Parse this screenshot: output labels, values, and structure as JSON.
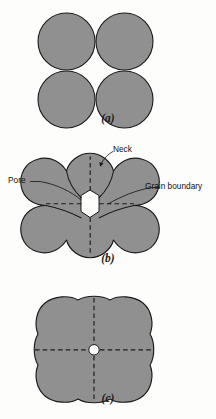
{
  "figure": {
    "type": "diagram",
    "background_color": "#fdfdfc",
    "particle_fill": "#909090",
    "outline_color": "#1a1a1a",
    "pore_color": "#ffffff"
  },
  "panels": [
    {
      "id": "a",
      "caption": "(a)",
      "description": "Four separate tangent spherical particles before sintering",
      "particle_count": 4,
      "pore": "none",
      "boundaries": "none"
    },
    {
      "id": "b",
      "caption": "(b)",
      "description": "Particles coalesced with necks formed; diamond-shaped pore at center with grain boundaries",
      "particle_count": 4,
      "pore": "diamond",
      "boundaries": "dashed"
    },
    {
      "id": "c",
      "caption": "(c)",
      "description": "Further densification; pore shrunk to small sphere, grain boundaries remain",
      "particle_count": 4,
      "pore": "circle",
      "boundaries": "dashed"
    }
  ],
  "annotations": {
    "neck": "Neck",
    "pore": "Pore",
    "grain_boundary": "Grain boundary"
  },
  "captions": {
    "a": "(a)",
    "b": "(b)",
    "c": "(c)"
  }
}
